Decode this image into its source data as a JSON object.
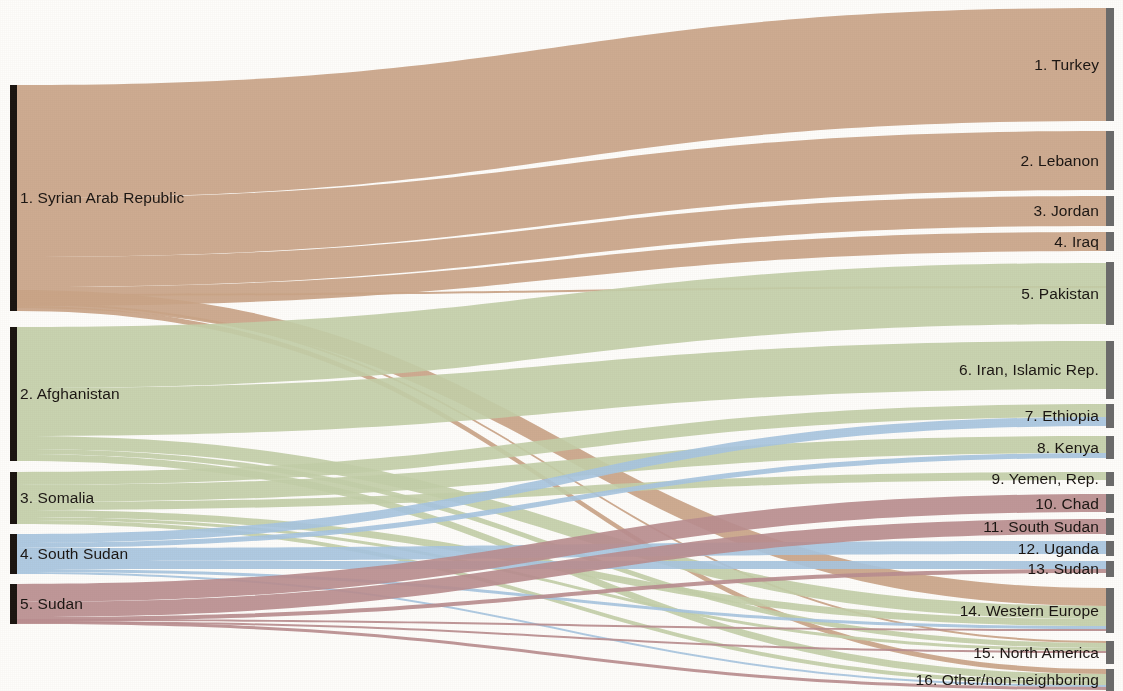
{
  "figure": {
    "type": "sankey",
    "title": "",
    "background_color": "#fefdfb",
    "source_node_color": "#1a1410",
    "target_node_color": "#6b6b6b"
  },
  "sources": [
    {
      "id": "syria",
      "label": "1. Syrian Arab Republic",
      "color": "#cba68a",
      "y0": 85,
      "y1": 311
    },
    {
      "id": "afghanistan",
      "label": "2. Afghanistan",
      "color": "#c4d1ad",
      "y0": 327,
      "y1": 461
    },
    {
      "id": "somalia",
      "label": "3. Somalia",
      "color": "#c4d1ad",
      "y0": 472,
      "y1": 524
    },
    {
      "id": "south_sudan",
      "label": "4. South Sudan",
      "color": "#a9c8e4",
      "y0": 534,
      "y1": 574
    },
    {
      "id": "sudan",
      "label": "5. Sudan",
      "color": "#bb8f92",
      "y0": 584,
      "y1": 624
    }
  ],
  "destinations": [
    {
      "id": "turkey",
      "label": "1. Turkey",
      "y0": 8,
      "y1": 121
    },
    {
      "id": "lebanon",
      "label": "2. Lebanon",
      "y0": 131,
      "y1": 190
    },
    {
      "id": "jordan",
      "label": "3. Jordan",
      "y0": 196,
      "y1": 226
    },
    {
      "id": "iraq",
      "label": "4. Iraq",
      "y0": 232,
      "y1": 251
    },
    {
      "id": "pakistan",
      "label": "5. Pakistan",
      "y0": 262,
      "y1": 325
    },
    {
      "id": "iran",
      "label": "6. Iran, Islamic Rep.",
      "y0": 341,
      "y1": 399
    },
    {
      "id": "ethiopia",
      "label": "7. Ethiopia",
      "y0": 404,
      "y1": 428
    },
    {
      "id": "kenya",
      "label": "8. Kenya",
      "y0": 436,
      "y1": 459
    },
    {
      "id": "yemen",
      "label": "9. Yemen, Rep.",
      "y0": 472,
      "y1": 486
    },
    {
      "id": "chad",
      "label": "10. Chad",
      "y0": 494,
      "y1": 513
    },
    {
      "id": "south_sudan_d",
      "label": "11. South Sudan",
      "y0": 518,
      "y1": 535
    },
    {
      "id": "uganda",
      "label": "12. Uganda",
      "y0": 541,
      "y1": 556
    },
    {
      "id": "sudan_d",
      "label": "13. Sudan",
      "y0": 561,
      "y1": 577
    },
    {
      "id": "western_europe",
      "label": "14. Western Europe",
      "y0": 588,
      "y1": 633
    },
    {
      "id": "north_america",
      "label": "15. North America",
      "y0": 641,
      "y1": 664
    },
    {
      "id": "other",
      "label": "16. Other/non-neighboring",
      "y0": 669,
      "y1": 691
    }
  ],
  "chart_data": {
    "type": "sankey",
    "xlabel": "",
    "ylabel": "",
    "note": "Refugee flows from top origin countries to host destinations; widths are proportional to refugee counts.",
    "links": [
      {
        "source": "syria",
        "target": "turkey",
        "value": 113,
        "sy0": 85,
        "sy1": 198,
        "ty0": 8,
        "ty1": 121
      },
      {
        "source": "syria",
        "target": "lebanon",
        "value": 59,
        "sy0": 198,
        "sy1": 257,
        "ty0": 131,
        "ty1": 190
      },
      {
        "source": "syria",
        "target": "jordan",
        "value": 30,
        "sy0": 257,
        "sy1": 287,
        "ty0": 196,
        "ty1": 226
      },
      {
        "source": "syria",
        "target": "iraq",
        "value": 19,
        "sy0": 287,
        "sy1": 306,
        "ty0": 232,
        "ty1": 251
      },
      {
        "source": "syria",
        "target": "pakistan",
        "value": 2,
        "sy0": 294,
        "sy1": 296,
        "ty0": 286,
        "ty1": 288
      },
      {
        "source": "syria",
        "target": "western_europe",
        "value": 18,
        "sy0": 290,
        "sy1": 308,
        "ty0": 588,
        "ty1": 606
      },
      {
        "source": "syria",
        "target": "north_america",
        "value": 2,
        "sy0": 303,
        "sy1": 305,
        "ty0": 641,
        "ty1": 643
      },
      {
        "source": "syria",
        "target": "other",
        "value": 5,
        "sy0": 306,
        "sy1": 311,
        "ty0": 669,
        "ty1": 674
      },
      {
        "source": "afghanistan",
        "target": "pakistan",
        "value": 61,
        "sy0": 327,
        "sy1": 388,
        "ty0": 263,
        "ty1": 324
      },
      {
        "source": "afghanistan",
        "target": "iran",
        "value": 48,
        "sy0": 388,
        "sy1": 436,
        "ty0": 341,
        "ty1": 389
      },
      {
        "source": "afghanistan",
        "target": "western_europe",
        "value": 13,
        "sy0": 436,
        "sy1": 449,
        "ty0": 606,
        "ty1": 619
      },
      {
        "source": "afghanistan",
        "target": "north_america",
        "value": 5,
        "sy0": 449,
        "sy1": 454,
        "ty0": 643,
        "ty1": 648
      },
      {
        "source": "afghanistan",
        "target": "other",
        "value": 7,
        "sy0": 454,
        "sy1": 461,
        "ty0": 674,
        "ty1": 681
      },
      {
        "source": "somalia",
        "target": "ethiopia",
        "value": 13,
        "sy0": 472,
        "sy1": 485,
        "ty0": 404,
        "ty1": 417
      },
      {
        "source": "somalia",
        "target": "kenya",
        "value": 17,
        "sy0": 485,
        "sy1": 502,
        "ty0": 436,
        "ty1": 453
      },
      {
        "source": "somalia",
        "target": "yemen",
        "value": 8,
        "sy0": 502,
        "sy1": 510,
        "ty0": 472,
        "ty1": 480
      },
      {
        "source": "somalia",
        "target": "western_europe",
        "value": 7,
        "sy0": 510,
        "sy1": 517,
        "ty0": 619,
        "ty1": 626
      },
      {
        "source": "somalia",
        "target": "north_america",
        "value": 3,
        "sy0": 517,
        "sy1": 520,
        "ty0": 648,
        "ty1": 651
      },
      {
        "source": "somalia",
        "target": "other",
        "value": 4,
        "sy0": 520,
        "sy1": 524,
        "ty0": 681,
        "ty1": 685
      },
      {
        "source": "south_sudan",
        "target": "ethiopia",
        "value": 9,
        "sy0": 534,
        "sy1": 543,
        "ty0": 417,
        "ty1": 426
      },
      {
        "source": "south_sudan",
        "target": "kenya",
        "value": 5,
        "sy0": 543,
        "sy1": 548,
        "ty0": 453,
        "ty1": 458
      },
      {
        "source": "south_sudan",
        "target": "uganda",
        "value": 13,
        "sy0": 548,
        "sy1": 561,
        "ty0": 541,
        "ty1": 554
      },
      {
        "source": "south_sudan",
        "target": "sudan_d",
        "value": 8,
        "sy0": 561,
        "sy1": 569,
        "ty0": 561,
        "ty1": 569
      },
      {
        "source": "south_sudan",
        "target": "western_europe",
        "value": 3,
        "sy0": 569,
        "sy1": 572,
        "ty0": 626,
        "ty1": 629
      },
      {
        "source": "south_sudan",
        "target": "other",
        "value": 2,
        "sy0": 572,
        "sy1": 574,
        "ty0": 685,
        "ty1": 687
      },
      {
        "source": "sudan",
        "target": "chad",
        "value": 18,
        "sy0": 584,
        "sy1": 602,
        "ty0": 494,
        "ty1": 512
      },
      {
        "source": "sudan",
        "target": "south_sudan_d",
        "value": 15,
        "sy0": 602,
        "sy1": 617,
        "ty0": 519,
        "ty1": 534
      },
      {
        "source": "sudan",
        "target": "sudan_d",
        "value": 4,
        "sy0": 617,
        "sy1": 621,
        "ty0": 569,
        "ty1": 573
      },
      {
        "source": "sudan",
        "target": "western_europe",
        "value": 2,
        "sy0": 619,
        "sy1": 621,
        "ty0": 629,
        "ty1": 631
      },
      {
        "source": "sudan",
        "target": "north_america",
        "value": 2,
        "sy0": 621,
        "sy1": 623,
        "ty0": 651,
        "ty1": 653
      },
      {
        "source": "sudan",
        "target": "other",
        "value": 3,
        "sy0": 621,
        "sy1": 624,
        "ty0": 687,
        "ty1": 690
      }
    ]
  }
}
